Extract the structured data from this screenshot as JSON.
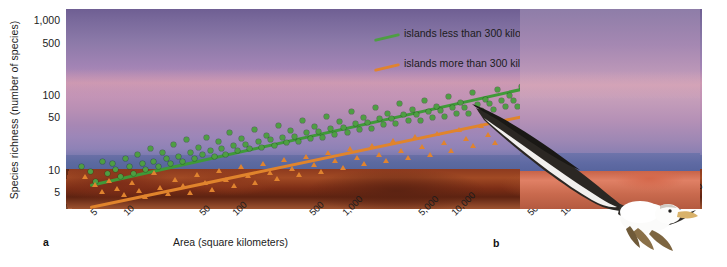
{
  "figure": {
    "panel_a_letter": "a",
    "panel_b_letter": "b"
  },
  "chart_data": {
    "type": "scatter",
    "title": "",
    "xlabel": "Area (square kilometers)",
    "ylabel": "Species richness (number of species)",
    "xscale": "log",
    "yscale": "log",
    "xlim": [
      3,
      2000000
    ],
    "ylim": [
      3,
      1400
    ],
    "grid": false,
    "legend_position": "upper-right-inside",
    "xticks": [
      "5",
      "10",
      "50",
      "100",
      "500",
      "1,000",
      "5,000",
      "10,000",
      "50,000",
      "100,000",
      "500,000",
      "1,000,000"
    ],
    "xtick_values": [
      5,
      10,
      50,
      100,
      500,
      1000,
      5000,
      10000,
      50000,
      100000,
      500000,
      1000000
    ],
    "yticks": [
      "5",
      "10",
      "50",
      "100",
      "500",
      "1,000"
    ],
    "ytick_values": [
      5,
      10,
      50,
      100,
      500,
      1000
    ],
    "series": [
      {
        "name": "islands less than 300 kilometers from source",
        "marker": "circle",
        "color": "#4e9e43",
        "trendline": {
          "x0": 5,
          "y0": 6.5,
          "x1": 900000,
          "y1": 330
        },
        "points": [
          [
            4.2,
            11
          ],
          [
            5.0,
            9.5
          ],
          [
            5.6,
            7.0
          ],
          [
            6.5,
            13
          ],
          [
            7.2,
            9.0
          ],
          [
            8.0,
            12
          ],
          [
            8.6,
            10
          ],
          [
            9.5,
            8.2
          ],
          [
            10.5,
            14
          ],
          [
            11.5,
            11
          ],
          [
            12.5,
            9.0
          ],
          [
            13.5,
            16
          ],
          [
            15,
            12
          ],
          [
            16,
            10
          ],
          [
            18,
            19
          ],
          [
            19,
            13
          ],
          [
            21,
            11
          ],
          [
            23,
            17
          ],
          [
            25,
            14
          ],
          [
            27,
            12
          ],
          [
            29,
            22
          ],
          [
            32,
            15
          ],
          [
            35,
            13
          ],
          [
            38,
            25
          ],
          [
            41,
            17
          ],
          [
            45,
            14
          ],
          [
            49,
            20
          ],
          [
            53,
            16
          ],
          [
            58,
            27
          ],
          [
            63,
            18
          ],
          [
            68,
            15
          ],
          [
            74,
            24
          ],
          [
            80,
            19
          ],
          [
            87,
            16
          ],
          [
            95,
            31
          ],
          [
            103,
            21
          ],
          [
            112,
            18
          ],
          [
            122,
            26
          ],
          [
            133,
            22
          ],
          [
            145,
            19
          ],
          [
            158,
            34
          ],
          [
            172,
            24
          ],
          [
            187,
            20
          ],
          [
            204,
            29
          ],
          [
            222,
            25
          ],
          [
            242,
            21
          ],
          [
            264,
            39
          ],
          [
            287,
            27
          ],
          [
            313,
            23
          ],
          [
            341,
            33
          ],
          [
            371,
            28
          ],
          [
            404,
            24
          ],
          [
            440,
            45
          ],
          [
            479,
            31
          ],
          [
            522,
            26
          ],
          [
            568,
            38
          ],
          [
            619,
            32
          ],
          [
            674,
            27
          ],
          [
            734,
            52
          ],
          [
            800,
            36
          ],
          [
            871,
            30
          ],
          [
            949,
            44
          ],
          [
            1034,
            37
          ],
          [
            1126,
            31
          ],
          [
            1227,
            60
          ],
          [
            1336,
            42
          ],
          [
            1456,
            35
          ],
          [
            1586,
            50
          ],
          [
            1727,
            43
          ],
          [
            1881,
            36
          ],
          [
            2049,
            68
          ],
          [
            2232,
            48
          ],
          [
            2432,
            40
          ],
          [
            2649,
            57
          ],
          [
            2886,
            49
          ],
          [
            3144,
            41
          ],
          [
            3425,
            76
          ],
          [
            3731,
            54
          ],
          [
            4064,
            45
          ],
          [
            4427,
            64
          ],
          [
            4823,
            55
          ],
          [
            5253,
            46
          ],
          [
            5723,
            85
          ],
          [
            6234,
            60
          ],
          [
            6791,
            50
          ],
          [
            7398,
            71
          ],
          [
            8059,
            61
          ],
          [
            8780,
            51
          ],
          [
            9564,
            95
          ],
          [
            10420,
            67
          ],
          [
            11350,
            56
          ],
          [
            12364,
            79
          ],
          [
            13468,
            68
          ],
          [
            14671,
            57
          ],
          [
            15982,
            106
          ],
          [
            17410,
            74
          ],
          [
            18966,
            62
          ],
          [
            20660,
            88
          ],
          [
            22506,
            76
          ],
          [
            24516,
            64
          ],
          [
            26706,
            118
          ],
          [
            29091,
            83
          ],
          [
            31690,
            69
          ],
          [
            34521,
            98
          ],
          [
            37603,
            84
          ],
          [
            40961,
            71
          ],
          [
            44619,
            131
          ],
          [
            48602,
            92
          ],
          [
            52942,
            77
          ],
          [
            57669,
            109
          ],
          [
            62819,
            94
          ],
          [
            68429,
            79
          ],
          [
            74540,
            146
          ],
          [
            81196,
            102
          ],
          [
            88446,
            86
          ],
          [
            96343,
            121
          ],
          [
            104945,
            104
          ],
          [
            114315,
            88
          ],
          [
            124521,
            162
          ],
          [
            135640,
            114
          ],
          [
            147752,
            96
          ],
          [
            160947,
            135
          ],
          [
            175318,
            116
          ],
          [
            190972,
            98
          ],
          [
            208022,
            180
          ],
          [
            226594,
            127
          ],
          [
            246822,
            107
          ],
          [
            268857,
            150
          ],
          [
            292857,
            129
          ],
          [
            319000,
            109
          ],
          [
            347480,
            200
          ],
          [
            378500,
            141
          ],
          [
            412300,
            119
          ],
          [
            449100,
            167
          ],
          [
            489200,
            143
          ],
          [
            532900,
            121
          ],
          [
            580500,
            222
          ],
          [
            632400,
            157
          ],
          [
            688900,
            132
          ],
          [
            750400,
            186
          ],
          [
            817400,
            160
          ],
          [
            890400,
            134
          ]
        ]
      },
      {
        "name": "islands more than 300 kilometers from source",
        "marker": "triangle",
        "color": "#e0832f",
        "trendline": {
          "x0": 5,
          "y0": 3.3,
          "x1": 1300000,
          "y1": 150
        },
        "points": [
          [
            4.5,
            8.0
          ],
          [
            5.5,
            6.2
          ],
          [
            6.4,
            5.0
          ],
          [
            7.5,
            7.2
          ],
          [
            8.8,
            5.6
          ],
          [
            10.2,
            4.6
          ],
          [
            12,
            6.6
          ],
          [
            14,
            5.2
          ],
          [
            16,
            4.3
          ],
          [
            19,
            9.0
          ],
          [
            22,
            5.8
          ],
          [
            26,
            4.8
          ],
          [
            30,
            7.4
          ],
          [
            35,
            6.0
          ],
          [
            41,
            4.9
          ],
          [
            48,
            8.6
          ],
          [
            56,
            6.6
          ],
          [
            65,
            5.4
          ],
          [
            76,
            9.6
          ],
          [
            88,
            7.4
          ],
          [
            103,
            6.0
          ],
          [
            120,
            10.8
          ],
          [
            140,
            8.2
          ],
          [
            163,
            6.7
          ],
          [
            190,
            12
          ],
          [
            221,
            9.2
          ],
          [
            258,
            7.5
          ],
          [
            300,
            13.5
          ],
          [
            350,
            10.4
          ],
          [
            408,
            8.4
          ],
          [
            476,
            15
          ],
          [
            554,
            11.6
          ],
          [
            646,
            9.4
          ],
          [
            753,
            17
          ],
          [
            877,
            13
          ],
          [
            1022,
            10.5
          ],
          [
            1191,
            19
          ],
          [
            1388,
            14.5
          ],
          [
            1618,
            11.8
          ],
          [
            1886,
            21
          ],
          [
            2198,
            16
          ],
          [
            2561,
            13
          ],
          [
            2985,
            24
          ],
          [
            3479,
            18
          ],
          [
            4054,
            14.6
          ],
          [
            4725,
            27
          ],
          [
            5507,
            20
          ],
          [
            6418,
            16
          ],
          [
            7480,
            30
          ],
          [
            8718,
            23
          ],
          [
            10160,
            18
          ],
          [
            11840,
            34
          ],
          [
            13800,
            26
          ],
          [
            16080,
            21
          ],
          [
            18740,
            38
          ],
          [
            21840,
            29
          ],
          [
            25450,
            23
          ],
          [
            29660,
            42
          ],
          [
            34570,
            32
          ],
          [
            40290,
            26
          ],
          [
            46960,
            47
          ],
          [
            54730,
            36
          ],
          [
            63780,
            29
          ],
          [
            74330,
            53
          ],
          [
            86630,
            40
          ],
          [
            100960,
            32
          ],
          [
            117660,
            59
          ],
          [
            137130,
            45
          ],
          [
            159800,
            36
          ],
          [
            186240,
            66
          ],
          [
            217050,
            50
          ],
          [
            252940,
            40
          ],
          [
            294780,
            74
          ],
          [
            343500,
            56
          ],
          [
            400320,
            45
          ],
          [
            466540,
            83
          ],
          [
            543700,
            63
          ],
          [
            633600,
            50
          ],
          [
            738400,
            93
          ],
          [
            860500,
            70
          ],
          [
            1002800,
            56
          ],
          [
            1168500,
            104
          ]
        ]
      }
    ]
  },
  "legend": {
    "entries": [
      {
        "label": "islands less than 300 kilometers from source",
        "color": "#4e9e43"
      },
      {
        "label": "islands more than 300 kilometers from source",
        "color": "#e0832f"
      }
    ]
  },
  "panel_b": {
    "subject": "albatross-in-flight-photo",
    "alt": "Seabird gliding over a rocky coastline at dusk"
  }
}
